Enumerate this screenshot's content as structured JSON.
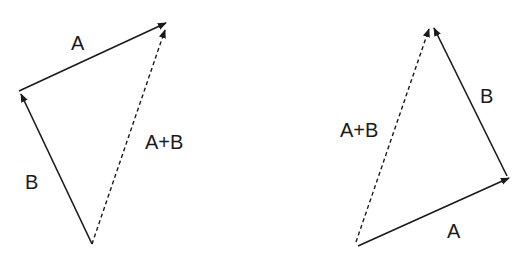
{
  "colors": {
    "stroke": "#1a1a1a",
    "background": "#ffffff"
  },
  "left_diagram": {
    "labels": {
      "a": "A",
      "b": "B",
      "sum": "A+B"
    },
    "vectors": [
      {
        "name": "B",
        "from": [
          92,
          244
        ],
        "to": [
          20,
          92
        ],
        "style": "solid"
      },
      {
        "name": "A",
        "from": [
          20,
          91
        ],
        "to": [
          167,
          23
        ],
        "style": "solid"
      },
      {
        "name": "A+B",
        "from": [
          92,
          244
        ],
        "to": [
          165,
          30
        ],
        "style": "dashed"
      }
    ]
  },
  "right_diagram": {
    "labels": {
      "a": "A",
      "b": "B",
      "sum": "A+B"
    },
    "vectors": [
      {
        "name": "A",
        "from": [
          358,
          246
        ],
        "to": [
          510,
          177
        ],
        "style": "solid"
      },
      {
        "name": "B",
        "from": [
          507,
          175
        ],
        "to": [
          434,
          26
        ],
        "style": "solid"
      },
      {
        "name": "A+B",
        "from": [
          356,
          242
        ],
        "to": [
          430,
          27
        ],
        "style": "dashed"
      }
    ]
  }
}
